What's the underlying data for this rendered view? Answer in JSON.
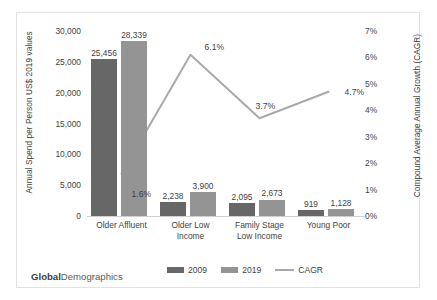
{
  "branding": {
    "bold": "Global",
    "rest": "Demographics"
  },
  "chart_data": {
    "type": "bar",
    "title": "",
    "subtitle": "",
    "categories": [
      "Older Affluent",
      "Older Low Income",
      "Family Stage Low Income",
      "Young Poor"
    ],
    "category_lines": [
      [
        "Older Affluent"
      ],
      [
        "Older Low",
        "Income"
      ],
      [
        "Family Stage",
        "Low Income"
      ],
      [
        "Young Poor"
      ]
    ],
    "series": [
      {
        "name": "2009",
        "type": "bar",
        "axis": "left",
        "color": "#676767",
        "values": [
          25456,
          2238,
          2095,
          919
        ],
        "labels": [
          "25,456",
          "2,238",
          "2,095",
          "919"
        ]
      },
      {
        "name": "2019",
        "type": "bar",
        "axis": "left",
        "color": "#949494",
        "values": [
          28339,
          3900,
          2673,
          1128
        ],
        "labels": [
          "28,339",
          "3,900",
          "2,673",
          "1,128"
        ]
      },
      {
        "name": "CAGR",
        "type": "line",
        "axis": "right",
        "color": "#a9a9a9",
        "values": [
          1.6,
          6.1,
          3.7,
          4.7
        ],
        "labels": [
          "1.6%",
          "6.1%",
          "3.7%",
          "4.7%"
        ]
      }
    ],
    "xlabel": "",
    "ylabel": "Annual Spend per Person US$ 2019 values",
    "y2label": "Compound Average Annual Growth (CAGR)",
    "ylim": [
      0,
      30000
    ],
    "y2lim": [
      0,
      7
    ],
    "yticks": [
      0,
      5000,
      10000,
      15000,
      20000,
      25000,
      30000
    ],
    "ytick_labels": [
      "0",
      "5,000",
      "10,000",
      "15,000",
      "20,000",
      "25,000",
      "30,000"
    ],
    "y2ticks": [
      0,
      1,
      2,
      3,
      4,
      5,
      6,
      7
    ],
    "y2tick_labels": [
      "0%",
      "1%",
      "2%",
      "3%",
      "4%",
      "5%",
      "6%",
      "7%"
    ],
    "grid": false,
    "legend_position": "bottom",
    "legend": [
      "2009",
      "2019",
      "CAGR"
    ]
  }
}
